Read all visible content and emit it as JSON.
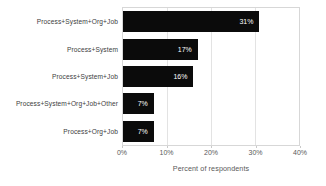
{
  "chart_data": {
    "type": "bar",
    "orientation": "horizontal",
    "categories": [
      "Process+System+Org+Job",
      "Process+System",
      "Process+System+Job",
      "Process+System+Org+Job+Other",
      "Process+Org+Job"
    ],
    "values": [
      31,
      17,
      16,
      7,
      7
    ],
    "data_labels": [
      "31%",
      "17%",
      "16%",
      "7%",
      "7%"
    ],
    "title": "",
    "xlabel": "Percent of respondents",
    "ylabel": "",
    "xlim": [
      0,
      40
    ],
    "x_tick_values": [
      0,
      10,
      20,
      30,
      40
    ],
    "x_tick_labels": [
      "0%",
      "10%",
      "20%",
      "30%",
      "40%"
    ],
    "grid": "vertical",
    "legend": "none",
    "colors": {
      "bar": "#0b0b0b",
      "bar_label": "#ffffff",
      "gridline": "#e3e3e3",
      "plot_border": "#d7d7d7",
      "axis_text": "#595959",
      "category_text": "#3d3d3d",
      "background": "#ffffff"
    }
  }
}
